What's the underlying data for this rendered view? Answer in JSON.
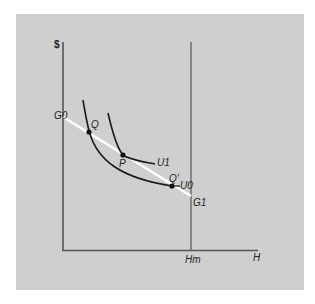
{
  "diagram": {
    "type": "indifference-curve-budget",
    "colors": {
      "background": "#ffffff",
      "panel": "#cfcfcf",
      "axes": "#555555",
      "curves": "#1a1a1a",
      "budget_line": "#ffffff"
    },
    "axes": {
      "y_label": "$",
      "x_label": "H",
      "x_marker_label": "Hm"
    },
    "budget_line": {
      "start_label": "G0",
      "end_label": "G1"
    },
    "curves": [
      {
        "name": "U0",
        "label": "U0"
      },
      {
        "name": "U1",
        "label": "U1"
      }
    ],
    "points": [
      {
        "name": "Q",
        "label": "Q"
      },
      {
        "name": "P",
        "label": "P"
      },
      {
        "name": "Q-prime",
        "label": "Q'"
      }
    ]
  }
}
